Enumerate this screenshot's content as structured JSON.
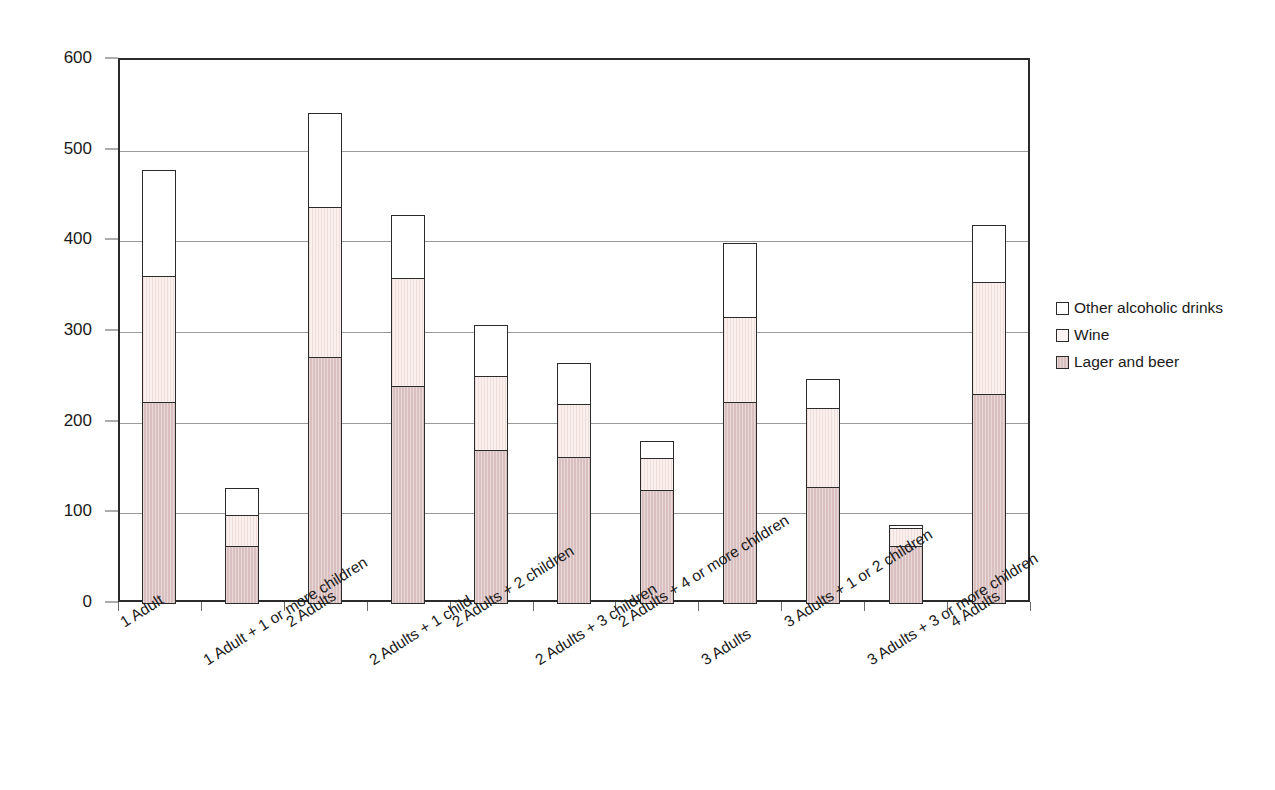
{
  "chart_data": {
    "type": "bar",
    "subtype": "stacked-vertical",
    "title": "",
    "subtitle": "",
    "xlabel": "",
    "ylabel": "",
    "ylim": [
      0,
      600
    ],
    "y_ticks": [
      0,
      100,
      200,
      300,
      400,
      500,
      600
    ],
    "grid": true,
    "grid_axis": "y",
    "legend_position": "right",
    "categories": [
      "1 Adult",
      "1 Adult + 1 or more children",
      "2 Adults",
      "2 Adults + 1 child",
      "2 Adults + 2 children",
      "2 Adults + 3 children",
      "2 Adults + 4 or more children",
      "3 Adults",
      "3 Adults + 1 or 2 children",
      "3 Adults + 3 or more children",
      "4 Adults"
    ],
    "series": [
      {
        "name": "Lager and beer",
        "color": "#d9bfbf",
        "values": [
          222,
          64,
          272,
          240,
          169,
          162,
          125,
          222,
          129,
          63,
          231
        ]
      },
      {
        "name": "Wine",
        "color": "#faf1ef",
        "values": [
          141,
          36,
          167,
          121,
          84,
          60,
          37,
          96,
          88,
          22,
          126
        ]
      },
      {
        "name": "Other alcoholic drinks",
        "color": "#ffffff",
        "values": [
          119,
          31,
          106,
          71,
          58,
          47,
          21,
          83,
          34,
          5,
          64
        ]
      }
    ],
    "totals": [
      482,
      131,
      545,
      432,
      311,
      269,
      183,
      401,
      251,
      90,
      421
    ],
    "cumulative_tops": {
      "lager": [
        222,
        64,
        272,
        240,
        169,
        162,
        125,
        222,
        129,
        63,
        231
      ],
      "wine": [
        363,
        100,
        439,
        361,
        253,
        222,
        162,
        318,
        217,
        85,
        357
      ],
      "other": [
        482,
        131,
        545,
        432,
        311,
        269,
        183,
        401,
        251,
        90,
        421
      ]
    }
  },
  "legend": {
    "items": [
      {
        "label": "Other alcoholic drinks",
        "swatch": "other"
      },
      {
        "label": "Wine",
        "swatch": "wine"
      },
      {
        "label": "Lager and beer",
        "swatch": "lager"
      }
    ]
  },
  "axis": {
    "y_tick_labels": [
      "600",
      "500",
      "400",
      "300",
      "200",
      "100",
      "0"
    ]
  },
  "colors": {
    "lager": "#d9bfbf",
    "wine": "#faf1ef",
    "other": "#ffffff",
    "outline": "#2b2b2b",
    "grid": "#9a9a9a",
    "text": "#1a1a1a"
  }
}
